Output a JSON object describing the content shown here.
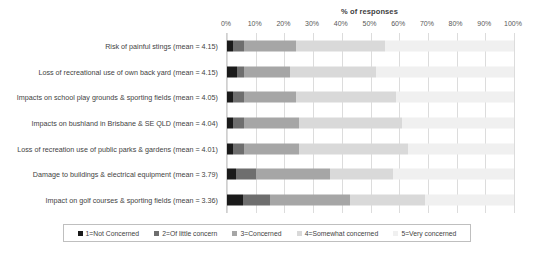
{
  "chart_data": {
    "type": "bar",
    "subtype": "stacked-horizontal-100",
    "title": "% of responses",
    "xlabel": "% of responses",
    "ylabel": "",
    "xlim": [
      0,
      100
    ],
    "xticks": [
      "0%",
      "10%",
      "20%",
      "30%",
      "40%",
      "50%",
      "60%",
      "70%",
      "80%",
      "90%",
      "100%"
    ],
    "xtick_values": [
      0,
      10,
      20,
      30,
      40,
      50,
      60,
      70,
      80,
      90,
      100
    ],
    "grid": true,
    "legend_position": "bottom",
    "categories": [
      "Risk of painful stings (mean = 4.15)",
      "Loss of recreational use of own back yard (mean = 4.15)",
      "Impacts on school play grounds & sporting fields (mean = 4.05)",
      "Impacts on bushland in Brisbane & SE QLD (mean = 4.04)",
      "Loss of recreation use of public parks & gardens (mean = 4.01)",
      "Damage to buildings & electrical equipment (mean = 3.79)",
      "Impact on golf courses & sporting fields (mean = 3.36)"
    ],
    "series": [
      {
        "name": "1=Not Concerned",
        "color": "#1a1a1a",
        "values": [
          2.0,
          3.5,
          2.0,
          2.0,
          2.0,
          3.0,
          5.5
        ]
      },
      {
        "name": "2=Of little concern",
        "color": "#6e6e6e",
        "values": [
          4.0,
          2.5,
          4.0,
          4.0,
          4.0,
          7.0,
          9.5
        ]
      },
      {
        "name": "3=Concerned",
        "color": "#a6a6a6",
        "values": [
          18.0,
          16.0,
          18.0,
          19.0,
          19.0,
          26.0,
          28.0
        ]
      },
      {
        "name": "4=Somewhat concerned",
        "color": "#d9d9d9",
        "values": [
          31.0,
          30.0,
          35.0,
          36.0,
          38.0,
          22.0,
          26.0
        ]
      },
      {
        "name": "5=Very concerned",
        "color": "#f0f0f0",
        "values": [
          45.0,
          48.0,
          41.0,
          39.0,
          37.0,
          42.0,
          31.0
        ]
      }
    ]
  },
  "legend": {
    "items": [
      {
        "label": "1=Not Concerned",
        "color": "#1a1a1a"
      },
      {
        "label": "2=Of little concern",
        "color": "#6e6e6e"
      },
      {
        "label": "3=Concerned",
        "color": "#a6a6a6"
      },
      {
        "label": "4=Somewhat concerned",
        "color": "#d9d9d9"
      },
      {
        "label": "5=Very concerned",
        "color": "#f0f0f0"
      }
    ]
  }
}
